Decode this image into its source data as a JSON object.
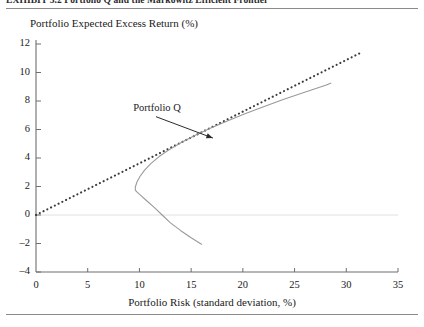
{
  "figure": {
    "caption": "EXHIBIT 3.2   Portfolio Q and the Markowitz Efficient Frontier",
    "y_axis_title": "Portfolio Expected Excess Return (%)",
    "x_axis_title": "Portfolio Risk (standard deviation, %)",
    "annotation_label": "Portfolio Q"
  },
  "chart_data": {
    "type": "line",
    "title": "Portfolio Q and the Markowitz Efficient Frontier",
    "xlabel": "Portfolio Risk (standard deviation, %)",
    "ylabel": "Portfolio Expected Excess Return (%)",
    "xlim": [
      0,
      35
    ],
    "ylim": [
      -4,
      12
    ],
    "xticks": [
      0,
      5,
      10,
      15,
      20,
      25,
      30,
      35
    ],
    "yticks": [
      -4,
      -2,
      0,
      2,
      4,
      6,
      8,
      10,
      12
    ],
    "grid": false,
    "zero_line": true,
    "legend": "none",
    "annotations": [
      {
        "text": "Portfolio Q",
        "label_x": 9.6,
        "label_y": 7.4,
        "arrow_from_x": 11.6,
        "arrow_from_y": 6.9,
        "arrow_to_x": 17.1,
        "arrow_to_y": 5.4
      }
    ],
    "series": [
      {
        "name": "Capital Allocation Line (tangent to frontier)",
        "style": "dotted",
        "color": "#3a3a3a",
        "points": [
          [
            0.0,
            0.0
          ],
          [
            31.3,
            11.35
          ]
        ]
      },
      {
        "name": "Markowitz Efficient Frontier (hyperbola)",
        "style": "solid",
        "color": "#9a9a9a",
        "min_variance_x": 9.6,
        "min_variance_y": 1.7,
        "points": [
          [
            16.0,
            -2.05
          ],
          [
            15.0,
            -1.6
          ],
          [
            14.0,
            -1.1
          ],
          [
            13.0,
            -0.55
          ],
          [
            12.2,
            0.0
          ],
          [
            11.4,
            0.55
          ],
          [
            10.7,
            1.0
          ],
          [
            10.1,
            1.4
          ],
          [
            9.75,
            1.62
          ],
          [
            9.6,
            1.75
          ],
          [
            9.6,
            1.95
          ],
          [
            9.75,
            2.3
          ],
          [
            10.05,
            2.7
          ],
          [
            10.5,
            3.15
          ],
          [
            11.1,
            3.6
          ],
          [
            11.9,
            4.1
          ],
          [
            12.9,
            4.6
          ],
          [
            14.1,
            5.1
          ],
          [
            15.4,
            5.6
          ],
          [
            16.9,
            6.1
          ],
          [
            18.5,
            6.6
          ],
          [
            20.2,
            7.1
          ],
          [
            22.0,
            7.6
          ],
          [
            23.9,
            8.1
          ],
          [
            25.9,
            8.6
          ],
          [
            28.0,
            9.1
          ],
          [
            28.5,
            9.25
          ]
        ]
      }
    ]
  }
}
